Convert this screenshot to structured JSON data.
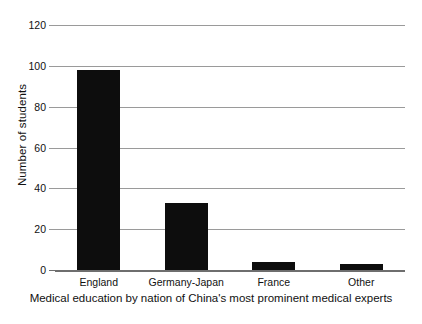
{
  "chart_data": {
    "type": "bar",
    "title": "",
    "subtitle": "",
    "xlabel": "Medical education by nation of China's most prominent medical experts",
    "ylabel": "Number of students",
    "categories": [
      "England",
      "Germany-Japan",
      "France",
      "Other"
    ],
    "values": [
      98,
      33,
      4,
      3
    ],
    "series": [
      {
        "name": "Number of students",
        "values": [
          98,
          33,
          4,
          3
        ]
      }
    ],
    "ylim": [
      0,
      120
    ],
    "ytick_values": [
      0,
      20,
      40,
      60,
      80,
      100,
      120
    ],
    "ytick_labels": [
      "0",
      "20",
      "40",
      "60",
      "80",
      "100",
      "120"
    ],
    "grid": "horizontal",
    "legend": "none",
    "bar_color": "#0d0d0d",
    "gridline_color": "#9a9a9a",
    "axis_color": "#6e6e6e",
    "background_color": "#ffffff",
    "text_color": "#111111",
    "annotations": []
  }
}
